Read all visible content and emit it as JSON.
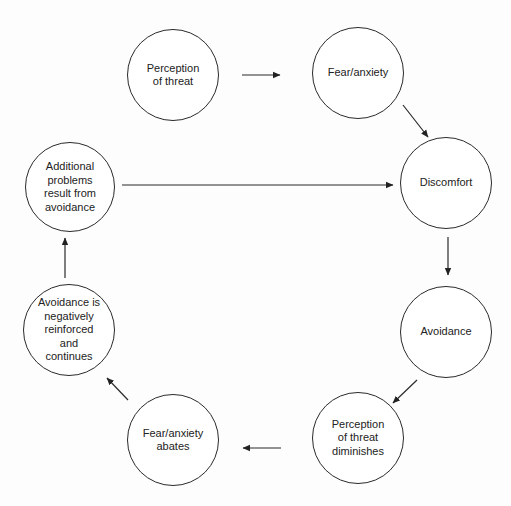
{
  "diagram": {
    "type": "cycle",
    "colors": {
      "stroke": "#2a2a2a",
      "text": "#222222",
      "background": "#fdfdfd"
    },
    "nodes": [
      {
        "id": "perception-of-threat",
        "label": "Perception\nof threat",
        "cx": 173,
        "cy": 75,
        "r": 46
      },
      {
        "id": "fear-anxiety",
        "label": "Fear/anxiety",
        "cx": 358,
        "cy": 73,
        "r": 46
      },
      {
        "id": "discomfort",
        "label": "Discomfort",
        "cx": 446,
        "cy": 183,
        "r": 46
      },
      {
        "id": "avoidance",
        "label": "Avoidance",
        "cx": 446,
        "cy": 332,
        "r": 46
      },
      {
        "id": "perception-of-threat-diminishes",
        "label": "Perception\nof threat\ndiminishes",
        "cx": 358,
        "cy": 438,
        "r": 46
      },
      {
        "id": "fear-anxiety-abates",
        "label": "Fear/anxiety\nabates",
        "cx": 173,
        "cy": 440,
        "r": 46
      },
      {
        "id": "avoidance-negatively-reinforced",
        "label": "Avoidance is\nnegatively\nreinforced\nand\ncontinues",
        "cx": 69,
        "cy": 330,
        "r": 46
      },
      {
        "id": "additional-problems",
        "label": "Additional\nproblems\nresult from\navoidance",
        "cx": 70,
        "cy": 187,
        "r": 45
      }
    ],
    "edges": [
      {
        "from": "perception-of-threat",
        "to": "fear-anxiety",
        "x1": 242,
        "y1": 75,
        "x2": 280,
        "y2": 75
      },
      {
        "from": "fear-anxiety",
        "to": "discomfort",
        "x1": 403,
        "y1": 105,
        "x2": 428,
        "y2": 137
      },
      {
        "from": "discomfort",
        "to": "avoidance",
        "x1": 448,
        "y1": 237,
        "x2": 448,
        "y2": 275
      },
      {
        "from": "avoidance",
        "to": "perception-of-threat-diminishes",
        "x1": 417,
        "y1": 380,
        "x2": 393,
        "y2": 403
      },
      {
        "from": "perception-of-threat-diminishes",
        "to": "fear-anxiety-abates",
        "x1": 281,
        "y1": 448,
        "x2": 243,
        "y2": 448
      },
      {
        "from": "fear-anxiety-abates",
        "to": "avoidance-negatively-reinforced",
        "x1": 128,
        "y1": 400,
        "x2": 107,
        "y2": 378
      },
      {
        "from": "avoidance-negatively-reinforced",
        "to": "additional-problems",
        "x1": 65,
        "y1": 278,
        "x2": 65,
        "y2": 238
      },
      {
        "from": "additional-problems",
        "to": "discomfort",
        "x1": 122,
        "y1": 185,
        "x2": 393,
        "y2": 185
      }
    ]
  }
}
